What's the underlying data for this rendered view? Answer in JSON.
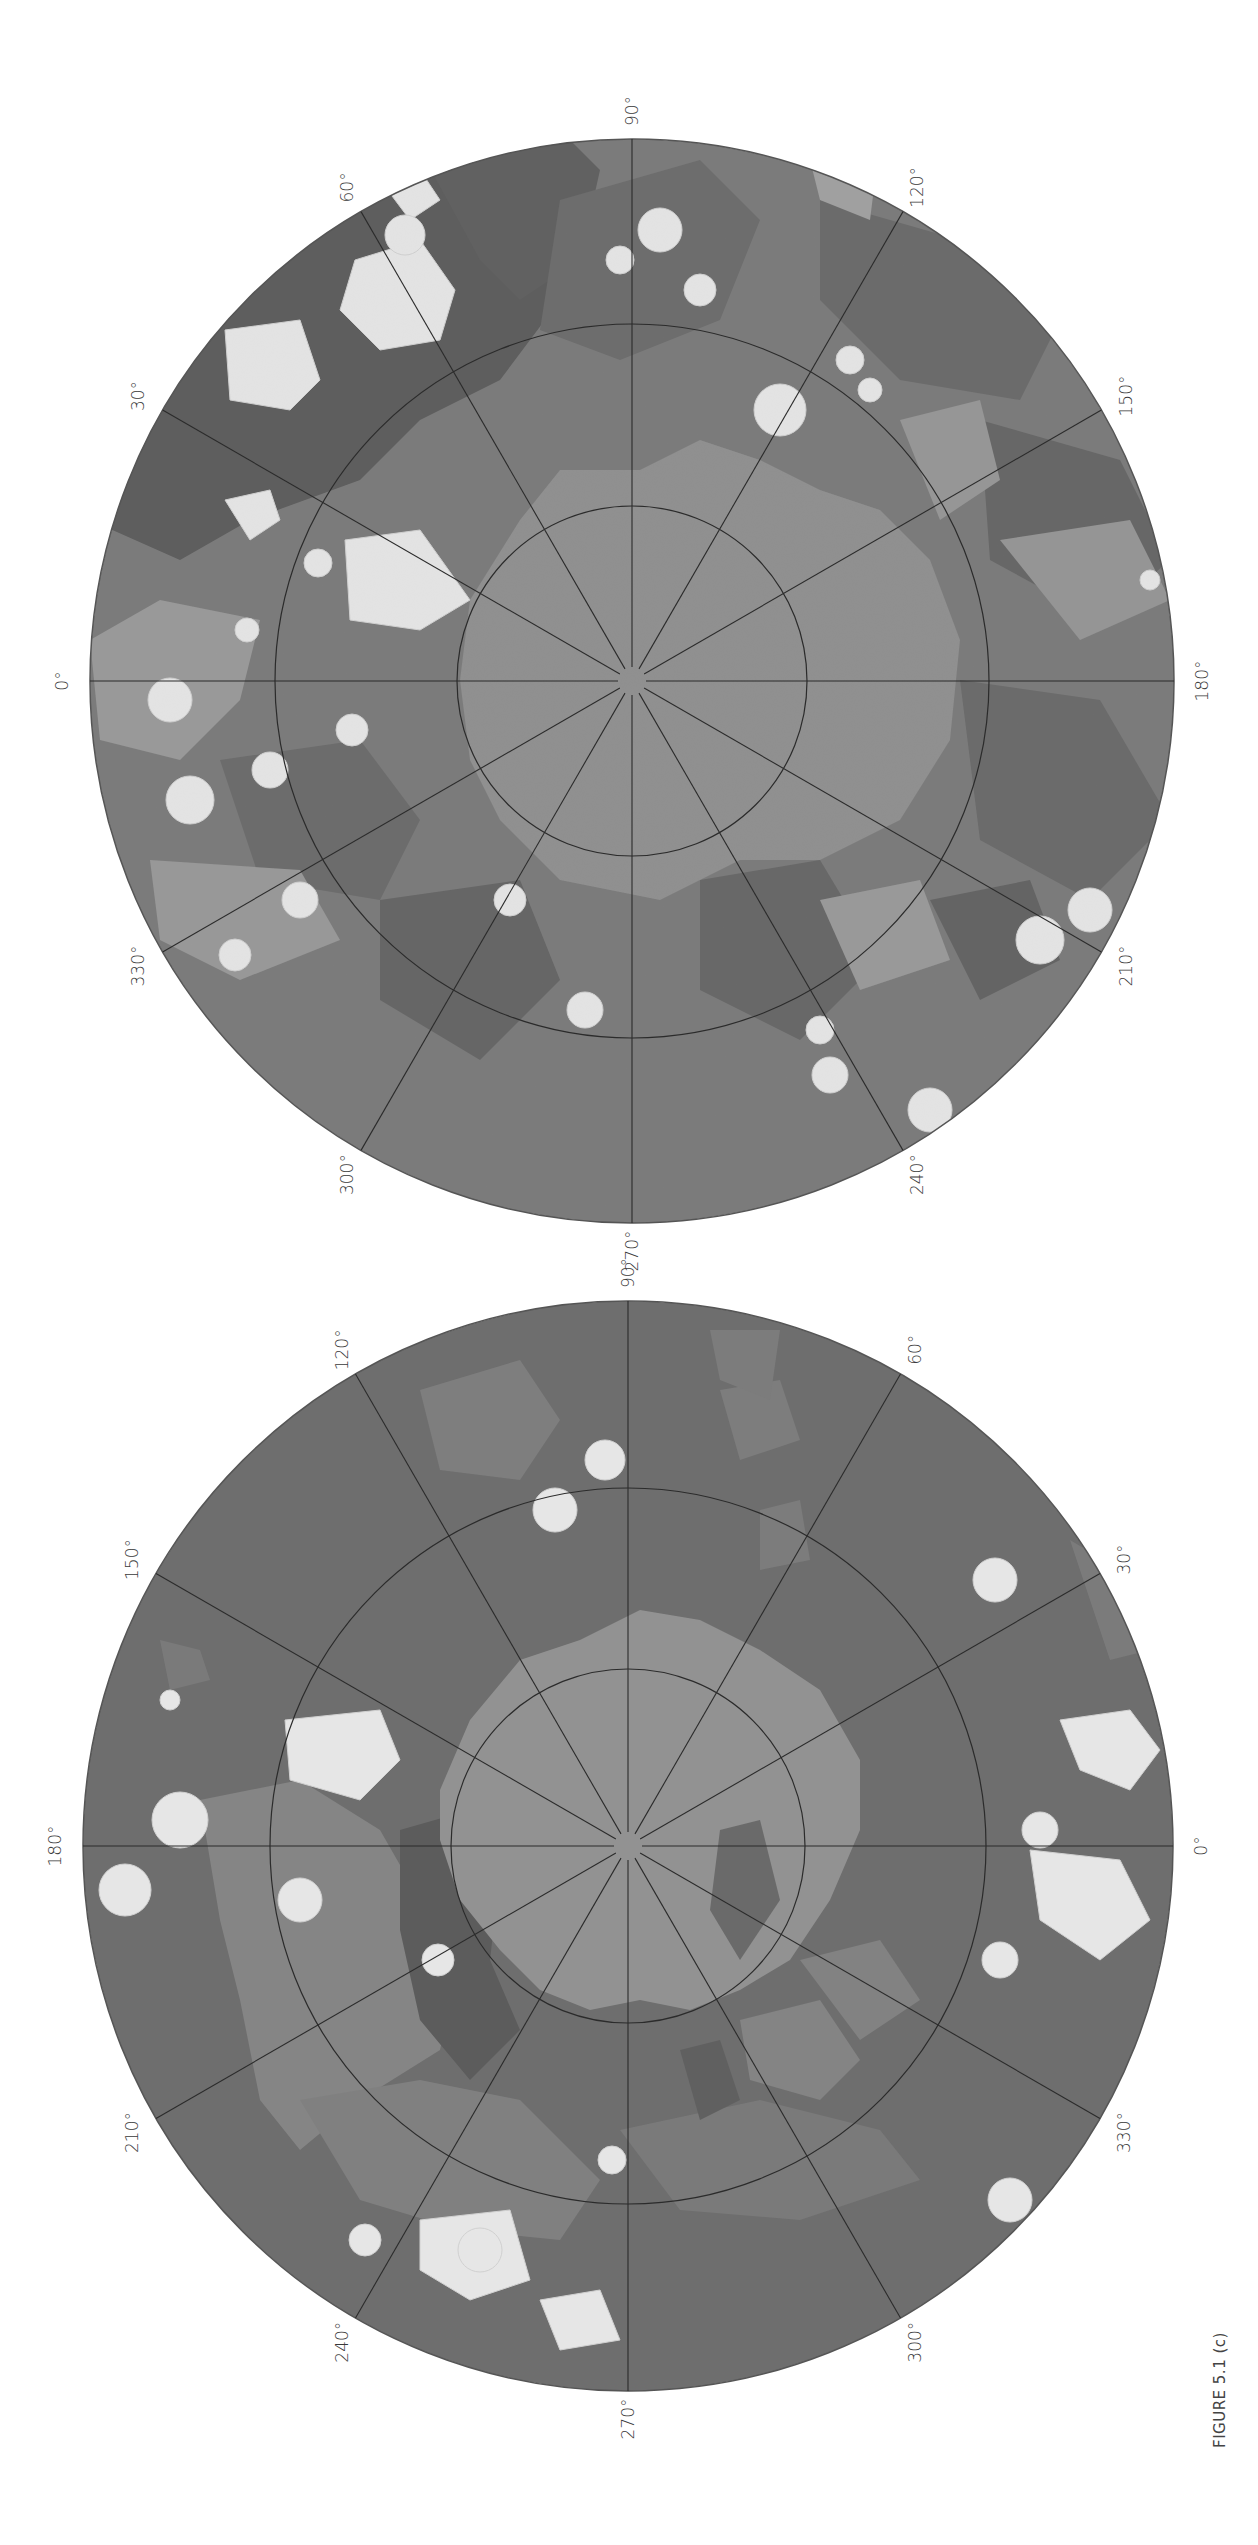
{
  "figure": {
    "caption": "FIGURE 5.1 (c)",
    "orientation": "page rotated 90° clockwise; text reads bottom-to-top",
    "colors": {
      "background": "#ffffff",
      "unit_darkest": "#5a5a5a",
      "unit_dark": "#6b6b6b",
      "unit_medium": "#7d7d7d",
      "unit_light": "#979797",
      "polar_cap": "#8f8f8f",
      "crater_ejecta": "#e6e6e6",
      "grid_line": "#2b2b2b"
    }
  },
  "maps": [
    {
      "id": "map-top",
      "description": "Polar stereographic geologic map (heavily cratered hemisphere)",
      "center": [
        632,
        681
      ],
      "radius": 542,
      "ring_radii": [
        175,
        357
      ],
      "orientation": "0° left, 90° top, 180° right, 270° bottom",
      "longitude_labels": [
        "0°",
        "30°",
        "60°",
        "90°",
        "120°",
        "150°",
        "180°",
        "210°",
        "240°",
        "270°",
        "300°",
        "330°"
      ]
    },
    {
      "id": "map-bottom",
      "description": "Polar stereographic geologic map (northern plains hemisphere)",
      "center": [
        628,
        1846
      ],
      "radius": 545,
      "ring_radii": [
        177,
        358
      ],
      "orientation": "0° right, 90° top, 180° left, 270° bottom",
      "longitude_labels": [
        "0°",
        "30°",
        "60°",
        "90°",
        "120°",
        "150°",
        "180°",
        "210°",
        "240°",
        "270°",
        "300°",
        "330°"
      ]
    }
  ]
}
